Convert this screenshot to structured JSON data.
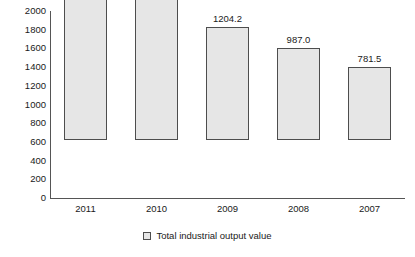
{
  "chart_data": {
    "type": "bar",
    "title": "",
    "subtitle": "",
    "xlabel": "",
    "ylabel": "",
    "categories": [
      "2011",
      "2010",
      "2009",
      "2008",
      "2007"
    ],
    "values": [
      1873,
      1527.7,
      1204.2,
      987.0,
      781.5
    ],
    "point_labels": [
      "1873",
      "1527.7",
      "1204.2",
      "987.0",
      "781.5"
    ],
    "series": [
      {
        "name": "Total industrial output value",
        "values": [
          1873,
          1527.7,
          1204.2,
          987.0,
          781.5
        ]
      }
    ],
    "ylim": [
      0,
      2000
    ],
    "ytick_step": 200,
    "ytick_labels": [
      "2000",
      "1800",
      "1600",
      "1400",
      "1200",
      "1000",
      "800",
      "600",
      "400",
      "200",
      "0"
    ],
    "ytick_values": [
      2000,
      1800,
      1600,
      1400,
      1200,
      1000,
      800,
      600,
      400,
      200,
      0
    ],
    "xtick_labels": [
      "2011",
      "2010",
      "2009",
      "2008",
      "2007"
    ],
    "grid": false,
    "legend": {
      "position": "bottom",
      "entries": [
        {
          "label": "Total industrial output value",
          "marker": "legend-swatch-square"
        }
      ]
    },
    "colors": {
      "bar_fill": "#e6e6e6",
      "bar_border": "#4d4d4d",
      "axis": "#555555",
      "text": "#1a1a1a",
      "background": "#ffffff"
    }
  }
}
